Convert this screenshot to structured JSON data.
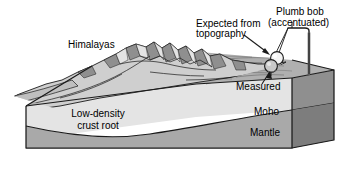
{
  "figure": {
    "background_color": "#ffffff",
    "labels": {
      "himalayas": "Himalayas",
      "expected_line1": "Expected from",
      "expected_line2": "topography",
      "plumb_line1": "Plumb bob",
      "plumb_line2": "(accentuated)",
      "measured": "Measured",
      "low_density_line1": "Low-density",
      "low_density_line2": "crust root",
      "moho": "Moho",
      "mantle": "Mantle"
    },
    "colors": {
      "outline": "#1a1a1a",
      "crust_front": "#e4e4e4",
      "crust_left": "#d2d2d2",
      "mantle_front": "#a9a9a9",
      "mantle_left": "#9a9a9a",
      "top_surface": "#b0b0b0",
      "side_face": "#8f8f8f",
      "mountain_light": "#d8d8d8",
      "mountain_shadow": "#8c8c8c",
      "sphere_expected": "#f2f2f2",
      "sphere_measured": "#c9c9c9",
      "background": "#ffffff"
    },
    "elements": {
      "sphere_expected_name": "expected-from-topography-bob",
      "sphere_measured_name": "measured-bob",
      "post_name": "plumb-bob-support-post"
    }
  }
}
